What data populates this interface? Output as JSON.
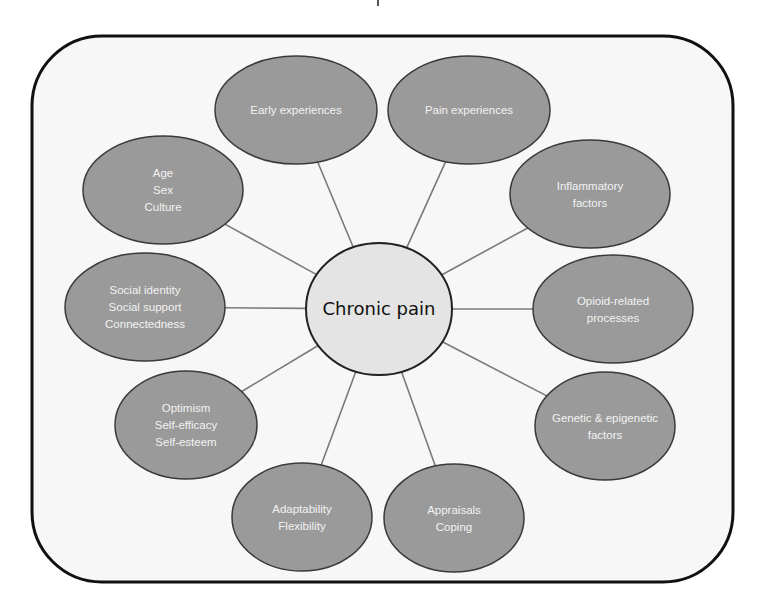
{
  "colors": {
    "frame_stroke": "#111111",
    "frame_fill": "#f7f7f7",
    "node_fill": "#9a9a9a",
    "node_stroke": "#3a3a3a",
    "center_fill": "#e4e4e4",
    "center_stroke": "#222222",
    "connector": "#7a7a7a",
    "node_text": "#f2f2f2",
    "center_text": "#111111"
  },
  "center": {
    "label": "Chronic pain",
    "cx": 379,
    "cy": 309,
    "rx": 73,
    "ry": 66
  },
  "nodes": [
    {
      "id": "early-experiences",
      "lines": [
        "Early experiences"
      ],
      "cx": 296,
      "cy": 110,
      "rx": 81,
      "ry": 54
    },
    {
      "id": "pain-experiences",
      "lines": [
        "Pain experiences"
      ],
      "cx": 469,
      "cy": 110,
      "rx": 81,
      "ry": 54
    },
    {
      "id": "inflammatory-factors",
      "lines": [
        "Inflammatory",
        "factors"
      ],
      "cx": 590,
      "cy": 194,
      "rx": 80,
      "ry": 54
    },
    {
      "id": "opioid-related-processes",
      "lines": [
        "Opioid-related",
        "processes"
      ],
      "cx": 613,
      "cy": 309,
      "rx": 80,
      "ry": 54
    },
    {
      "id": "genetic-epigenetic-factors",
      "lines": [
        "Genetic & epigenetic",
        "factors"
      ],
      "cx": 605,
      "cy": 426,
      "rx": 70,
      "ry": 54
    },
    {
      "id": "appraisals-coping",
      "lines": [
        "Appraisals",
        "Coping"
      ],
      "cx": 454,
      "cy": 518,
      "rx": 70,
      "ry": 54
    },
    {
      "id": "adaptability-flexibility",
      "lines": [
        "Adaptability",
        "Flexibility"
      ],
      "cx": 302,
      "cy": 517,
      "rx": 70,
      "ry": 54
    },
    {
      "id": "optimism-self-efficacy-self-esteem",
      "lines": [
        "Optimism",
        "Self-efficacy",
        "Self-esteem"
      ],
      "cx": 186,
      "cy": 425,
      "rx": 71,
      "ry": 54
    },
    {
      "id": "social-identity-support-connectedness",
      "lines": [
        "Social identity",
        "Social support",
        "Connectedness"
      ],
      "cx": 145,
      "cy": 307,
      "rx": 80,
      "ry": 54
    },
    {
      "id": "age-sex-culture",
      "lines": [
        "Age",
        "Sex",
        "Culture"
      ],
      "cx": 163,
      "cy": 190,
      "rx": 80,
      "ry": 54
    }
  ],
  "frame": {
    "x": 32,
    "y": 36,
    "width": 701,
    "height": 546,
    "radius": 70
  }
}
